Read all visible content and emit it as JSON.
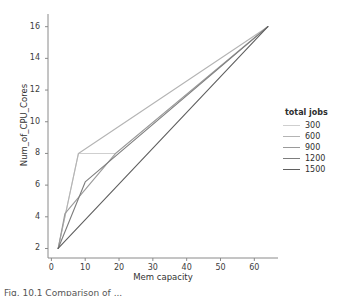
{
  "chart_data": {
    "type": "line",
    "title": "",
    "xlabel": "Mem capacity",
    "ylabel": "Num_of_CPU_Cores",
    "xlim": [
      -1,
      67
    ],
    "ylim": [
      1.4,
      16.8
    ],
    "xticks": [
      0,
      10,
      20,
      30,
      40,
      50,
      60
    ],
    "yticks": [
      2,
      4,
      6,
      8,
      10,
      12,
      14,
      16
    ],
    "grid": false,
    "legend": {
      "title": "total jobs",
      "position": "right",
      "entries": [
        "300",
        "600",
        "900",
        "1200",
        "1500"
      ]
    },
    "colors": [
      "#cfcfcf",
      "#b4b4b4",
      "#9a9a9a",
      "#7d7d7d",
      "#5f5f5f"
    ],
    "series": [
      {
        "name": "300",
        "color": "#cfcfcf",
        "points": [
          [
            2,
            2
          ],
          [
            8,
            8
          ],
          [
            19,
            8
          ],
          [
            64,
            16
          ]
        ]
      },
      {
        "name": "600",
        "color": "#b4b4b4",
        "points": [
          [
            2,
            2
          ],
          [
            8,
            8
          ],
          [
            64,
            16
          ]
        ]
      },
      {
        "name": "900",
        "color": "#9a9a9a",
        "points": [
          [
            2,
            2
          ],
          [
            4,
            4.2
          ],
          [
            19,
            8
          ],
          [
            64,
            16
          ]
        ]
      },
      {
        "name": "1200",
        "color": "#7d7d7d",
        "points": [
          [
            2,
            2
          ],
          [
            10,
            6.2
          ],
          [
            64,
            16
          ]
        ]
      },
      {
        "name": "1500",
        "color": "#5f5f5f",
        "points": [
          [
            2,
            2
          ],
          [
            64,
            16
          ]
        ]
      }
    ]
  },
  "axis": {
    "xticklabels": [
      "0",
      "10",
      "20",
      "30",
      "40",
      "50",
      "60"
    ],
    "yticklabels": [
      "2",
      "4",
      "6",
      "8",
      "10",
      "12",
      "14",
      "16"
    ]
  },
  "caption": {
    "text": "Fig. 10.1  Comparison of ..."
  }
}
